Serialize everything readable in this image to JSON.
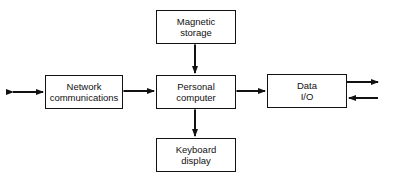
{
  "diagram": {
    "nodes": {
      "storage": {
        "line1": "Magnetic",
        "line2": "storage"
      },
      "network": {
        "line1": "Network",
        "line2": "communications"
      },
      "computer": {
        "line1": "Personal",
        "line2": "computer"
      },
      "keyboard": {
        "line1": "Keyboard",
        "line2": "display"
      },
      "dataio": {
        "line1": "Data",
        "line2": "I/O"
      }
    },
    "edges": [
      {
        "from": "computer",
        "to": "storage",
        "type": "bidirectional"
      },
      {
        "from": "computer",
        "to": "keyboard",
        "type": "bidirectional"
      },
      {
        "from": "computer",
        "to": "network",
        "type": "bidirectional"
      },
      {
        "from": "computer",
        "to": "dataio",
        "type": "bidirectional"
      },
      {
        "from": "network",
        "to": "external",
        "type": "bidirectional"
      },
      {
        "from": "dataio",
        "to": "external",
        "type": "output"
      },
      {
        "from": "external",
        "to": "dataio",
        "type": "input"
      }
    ]
  }
}
